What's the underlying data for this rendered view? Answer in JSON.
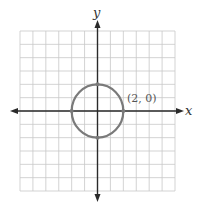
{
  "chart_data": {
    "type": "scatter",
    "subtype": "circle-on-coordinate-plane",
    "title": "",
    "xlabel": "x",
    "ylabel": "y",
    "xlim": [
      -6,
      6
    ],
    "ylim": [
      -6,
      6
    ],
    "grid": true,
    "grid_step": 1,
    "circle": {
      "center": [
        0,
        0
      ],
      "radius": 2,
      "color": "#7a7a7a"
    },
    "points": [
      {
        "x": 2,
        "y": 0
      },
      {
        "x": 0,
        "y": 2
      },
      {
        "x": -2,
        "y": 0
      },
      {
        "x": 0,
        "y": -2
      }
    ],
    "annotations": [
      {
        "text": "(2, 0)",
        "x": 2,
        "y": 0
      }
    ]
  },
  "labels": {
    "x_axis": "x",
    "y_axis": "y",
    "point": "(2, 0)"
  },
  "colors": {
    "grid": "#c8c8c8",
    "axis": "#2a2a2a",
    "circle": "#7a7a7a"
  }
}
